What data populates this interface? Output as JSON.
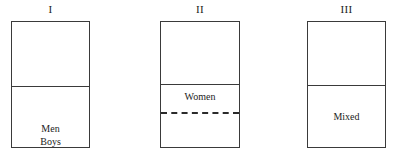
{
  "figure": {
    "background_color": "#ffffff",
    "stroke_color": "#3a3a3a",
    "text_color": "#1c1c1c",
    "width": 399,
    "height": 157
  },
  "panels": [
    {
      "title": "I",
      "box": {
        "x": 11,
        "y": 21,
        "width": 79,
        "height": 127
      },
      "dividers": [
        {
          "style": "solid",
          "y": 64
        }
      ],
      "labels": [
        {
          "text": "Men",
          "y": 100
        },
        {
          "text": "Boys",
          "y": 113
        }
      ]
    },
    {
      "title": "II",
      "box": {
        "x": 160,
        "y": 21,
        "width": 80,
        "height": 127
      },
      "dividers": [
        {
          "style": "solid",
          "y": 62
        },
        {
          "style": "dashed",
          "y": 90
        }
      ],
      "labels": [
        {
          "text": "Women",
          "y": 68
        }
      ]
    },
    {
      "title": "III",
      "box": {
        "x": 307,
        "y": 21,
        "width": 79,
        "height": 127
      },
      "dividers": [
        {
          "style": "solid",
          "y": 63
        }
      ],
      "labels": [
        {
          "text": "Mixed",
          "y": 88
        }
      ]
    }
  ]
}
